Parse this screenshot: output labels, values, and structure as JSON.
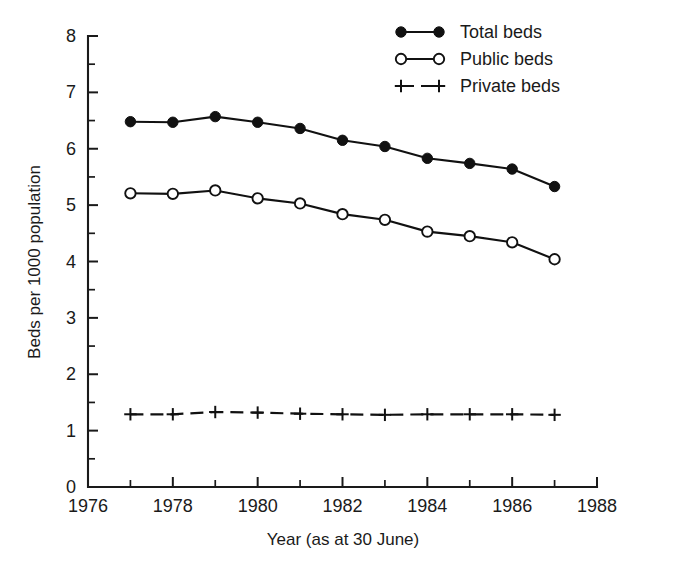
{
  "chart_data": {
    "type": "line",
    "title": "",
    "xlabel": "Year (as at 30 June)",
    "ylabel": "Beds per 1000 population",
    "xlim": [
      1976,
      1988
    ],
    "ylim": [
      0,
      8
    ],
    "x": [
      1977,
      1978,
      1979,
      1980,
      1981,
      1982,
      1983,
      1984,
      1985,
      1986,
      1987
    ],
    "xticks": [
      1976,
      1978,
      1980,
      1982,
      1984,
      1986,
      1988
    ],
    "xticklabels": [
      "1976",
      "1978",
      "1980",
      "1982",
      "1984",
      "1986",
      "1988"
    ],
    "xminorticks": [
      1977,
      1979,
      1981,
      1983,
      1985,
      1987
    ],
    "yticks": [
      0,
      1,
      2,
      3,
      4,
      5,
      6,
      7,
      8
    ],
    "yticklabels": [
      "0",
      "1",
      "2",
      "3",
      "4",
      "5",
      "6",
      "7",
      "8"
    ],
    "yminorticks": [
      0.5,
      1.5,
      2.5,
      3.5,
      4.5,
      5.5,
      6.5,
      7.5
    ],
    "grid": false,
    "legend_position": "top-right",
    "series": [
      {
        "name": "Total beds",
        "marker": "filled-circle",
        "linestyle": "solid",
        "color": "#111111",
        "values": [
          6.48,
          6.47,
          6.57,
          6.47,
          6.36,
          6.15,
          6.04,
          5.83,
          5.74,
          5.64,
          5.33
        ]
      },
      {
        "name": "Public beds",
        "marker": "open-circle",
        "linestyle": "solid",
        "color": "#111111",
        "values": [
          5.21,
          5.2,
          5.26,
          5.12,
          5.03,
          4.84,
          4.74,
          4.53,
          4.45,
          4.34,
          4.04
        ]
      },
      {
        "name": "Private beds",
        "marker": "plus",
        "linestyle": "dashed",
        "color": "#111111",
        "values": [
          1.29,
          1.29,
          1.33,
          1.32,
          1.3,
          1.29,
          1.28,
          1.29,
          1.29,
          1.29,
          1.28
        ]
      }
    ]
  },
  "legend": {
    "items": [
      {
        "label": "Total beds",
        "marker": "filled-circle",
        "linestyle": "solid"
      },
      {
        "label": "Public beds",
        "marker": "open-circle",
        "linestyle": "solid"
      },
      {
        "label": "Private beds",
        "marker": "plus",
        "linestyle": "dashed"
      }
    ]
  },
  "colors": {
    "ink": "#111111",
    "background": "#ffffff"
  }
}
